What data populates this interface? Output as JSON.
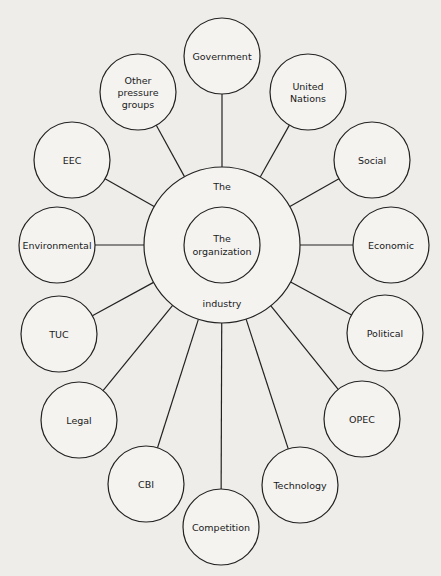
{
  "diagram": {
    "type": "hub-and-spoke",
    "center": {
      "outer_label_top": "The",
      "outer_label_bottom": "industry",
      "inner_label_line1": "The",
      "inner_label_line2": "organization",
      "cx": 222,
      "cy": 245,
      "outer_r": 78,
      "inner_r": 38
    },
    "nodes": [
      {
        "id": "government",
        "lines": [
          "Government"
        ],
        "cx": 222,
        "cy": 56
      },
      {
        "id": "united-nations",
        "lines": [
          "United",
          "Nations"
        ],
        "cx": 308,
        "cy": 92
      },
      {
        "id": "social",
        "lines": [
          "Social"
        ],
        "cx": 372,
        "cy": 160
      },
      {
        "id": "economic",
        "lines": [
          "Economic"
        ],
        "cx": 391,
        "cy": 245
      },
      {
        "id": "political",
        "lines": [
          "Political"
        ],
        "cx": 385,
        "cy": 333
      },
      {
        "id": "opec",
        "lines": [
          "OPEC"
        ],
        "cx": 362,
        "cy": 419
      },
      {
        "id": "technology",
        "lines": [
          "Technology"
        ],
        "cx": 300,
        "cy": 485
      },
      {
        "id": "competition",
        "lines": [
          "Competition"
        ],
        "cx": 221,
        "cy": 527
      },
      {
        "id": "cbi",
        "lines": [
          "CBI"
        ],
        "cx": 146,
        "cy": 484
      },
      {
        "id": "legal",
        "lines": [
          "Legal"
        ],
        "cx": 79,
        "cy": 420
      },
      {
        "id": "tuc",
        "lines": [
          "TUC"
        ],
        "cx": 59,
        "cy": 334
      },
      {
        "id": "environmental",
        "lines": [
          "Environmental"
        ],
        "cx": 57,
        "cy": 245
      },
      {
        "id": "eec",
        "lines": [
          "EEC"
        ],
        "cx": 72,
        "cy": 160
      },
      {
        "id": "other-pressure-groups",
        "lines": [
          "Other",
          "pressure",
          "groups"
        ],
        "cx": 138,
        "cy": 92
      }
    ],
    "node_r": 38
  }
}
